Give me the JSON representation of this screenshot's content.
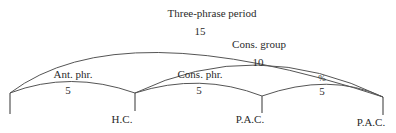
{
  "diagram": {
    "spans": [
      {
        "id": "three-phrase-period",
        "label": "Three-phrase period",
        "count": "15"
      },
      {
        "id": "cons-group",
        "label": "Cons. group",
        "count": "10"
      },
      {
        "id": "ant-phr",
        "label": "Ant. phr.",
        "count": "5"
      },
      {
        "id": "cons-phr",
        "label": "Cons. phr.",
        "count": "5"
      },
      {
        "id": "repeat",
        "label": "%",
        "count": "5"
      }
    ],
    "cadences": [
      {
        "id": "hc",
        "label": "H.C."
      },
      {
        "id": "pac-1",
        "label": "P.A.C."
      },
      {
        "id": "pac-2",
        "label": "P.A.C."
      }
    ]
  }
}
